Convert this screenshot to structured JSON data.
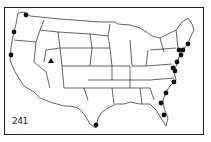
{
  "map": {
    "title": "United States map",
    "figure_label": "241",
    "colors": {
      "line": "#222222",
      "marker": "#111111",
      "background": "#ffffff"
    },
    "markers": [
      {
        "type": "circle",
        "region": "Washington",
        "x": 26,
        "y": 15
      },
      {
        "type": "circle",
        "region": "Oregon",
        "x": 14,
        "y": 32
      },
      {
        "type": "circle",
        "region": "California",
        "x": 11,
        "y": 55
      },
      {
        "type": "triangle",
        "region": "Utah",
        "x": 51,
        "y": 61
      },
      {
        "type": "circle",
        "region": "Texas",
        "x": 96,
        "y": 125
      },
      {
        "type": "circle",
        "region": "Florida",
        "x": 164,
        "y": 115
      },
      {
        "type": "circle",
        "region": "Florida",
        "x": 161,
        "y": 103
      },
      {
        "type": "circle",
        "region": "South Carolina",
        "x": 166,
        "y": 93
      },
      {
        "type": "circle",
        "region": "North Carolina",
        "x": 174,
        "y": 82
      },
      {
        "type": "circle",
        "region": "Virginia",
        "x": 173,
        "y": 68
      },
      {
        "type": "circle",
        "region": "Maryland",
        "x": 175,
        "y": 71
      },
      {
        "type": "circle",
        "region": "New Jersey",
        "x": 177,
        "y": 62
      },
      {
        "type": "circle",
        "region": "New York",
        "x": 181,
        "y": 55
      },
      {
        "type": "circle",
        "region": "Connecticut",
        "x": 179,
        "y": 50
      },
      {
        "type": "circle",
        "region": "Rhode Island",
        "x": 183,
        "y": 50
      },
      {
        "type": "circle",
        "region": "Massachusetts",
        "x": 188,
        "y": 44
      }
    ]
  }
}
